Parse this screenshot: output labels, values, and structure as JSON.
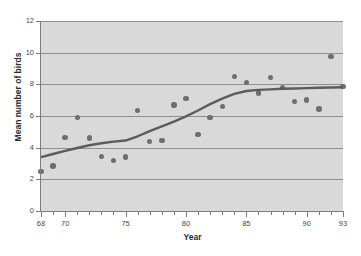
{
  "chart_data": {
    "type": "scatter",
    "title": "",
    "xlabel": "Year",
    "ylabel": "Mean number of birds",
    "xlim": [
      68,
      93
    ],
    "ylim": [
      0,
      12
    ],
    "grid": true,
    "legend": "none",
    "x_ticks_major": [
      68,
      70,
      75,
      80,
      85,
      90,
      93
    ],
    "x_tick_labels": [
      "68",
      "70",
      "75",
      "80",
      "85",
      "90",
      "93"
    ],
    "x_ticks_minor": [
      69,
      71,
      72,
      73,
      74,
      76,
      77,
      78,
      79,
      81,
      82,
      83,
      84,
      86,
      87,
      88,
      89,
      91,
      92
    ],
    "y_ticks": [
      0,
      2,
      4,
      6,
      8,
      10,
      12
    ],
    "y_tick_labels": [
      "0",
      "2",
      "4",
      "6",
      "8",
      "10",
      "12"
    ],
    "series": [
      {
        "name": "Mean number of birds",
        "marker": "circle",
        "color": "#6e6e6e",
        "points": [
          {
            "x": 68,
            "y": 2.5
          },
          {
            "x": 69,
            "y": 2.85
          },
          {
            "x": 70,
            "y": 4.65
          },
          {
            "x": 71,
            "y": 5.9
          },
          {
            "x": 72,
            "y": 4.6
          },
          {
            "x": 73,
            "y": 3.45
          },
          {
            "x": 74,
            "y": 3.2
          },
          {
            "x": 75,
            "y": 3.4
          },
          {
            "x": 76,
            "y": 6.35
          },
          {
            "x": 77,
            "y": 4.4
          },
          {
            "x": 78,
            "y": 4.45
          },
          {
            "x": 79,
            "y": 6.7
          },
          {
            "x": 80,
            "y": 7.1
          },
          {
            "x": 81,
            "y": 4.85
          },
          {
            "x": 82,
            "y": 5.9
          },
          {
            "x": 83,
            "y": 6.6
          },
          {
            "x": 84,
            "y": 8.5
          },
          {
            "x": 85,
            "y": 8.1
          },
          {
            "x": 86,
            "y": 7.45
          },
          {
            "x": 87,
            "y": 8.45
          },
          {
            "x": 88,
            "y": 7.8
          },
          {
            "x": 89,
            "y": 6.9
          },
          {
            "x": 90,
            "y": 7.0
          },
          {
            "x": 91,
            "y": 6.45
          },
          {
            "x": 92,
            "y": 9.75
          },
          {
            "x": 93,
            "y": 7.85
          }
        ]
      },
      {
        "name": "Smoothed trend",
        "marker": "none",
        "color": "#5c5c5c",
        "points": [
          {
            "x": 68,
            "y": 3.4
          },
          {
            "x": 69,
            "y": 3.6
          },
          {
            "x": 70,
            "y": 3.8
          },
          {
            "x": 71,
            "y": 3.98
          },
          {
            "x": 72,
            "y": 4.15
          },
          {
            "x": 73,
            "y": 4.28
          },
          {
            "x": 74,
            "y": 4.38
          },
          {
            "x": 75,
            "y": 4.45
          },
          {
            "x": 76,
            "y": 4.72
          },
          {
            "x": 77,
            "y": 5.05
          },
          {
            "x": 78,
            "y": 5.35
          },
          {
            "x": 79,
            "y": 5.65
          },
          {
            "x": 80,
            "y": 5.98
          },
          {
            "x": 81,
            "y": 6.35
          },
          {
            "x": 82,
            "y": 6.75
          },
          {
            "x": 83,
            "y": 7.1
          },
          {
            "x": 84,
            "y": 7.4
          },
          {
            "x": 85,
            "y": 7.58
          },
          {
            "x": 86,
            "y": 7.65
          },
          {
            "x": 87,
            "y": 7.68
          },
          {
            "x": 88,
            "y": 7.72
          },
          {
            "x": 89,
            "y": 7.74
          },
          {
            "x": 90,
            "y": 7.76
          },
          {
            "x": 91,
            "y": 7.78
          },
          {
            "x": 92,
            "y": 7.8
          },
          {
            "x": 93,
            "y": 7.82
          }
        ]
      }
    ],
    "colors": {
      "marker": "#6e6e6e",
      "trend_line": "#5c5c5c",
      "plot_background": "#d9d9d9",
      "gridline": "#8f8f8f",
      "axis": "#7d7d7d",
      "text": "#2b2b2b"
    }
  }
}
